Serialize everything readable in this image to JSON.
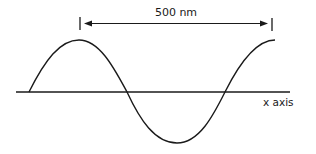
{
  "diagram": {
    "type": "sine-wave-wavelength",
    "wavelength_label": "500 nm",
    "axis_label": "x axis",
    "colors": {
      "stroke": "#1a1a1a",
      "background": "#ffffff"
    }
  }
}
